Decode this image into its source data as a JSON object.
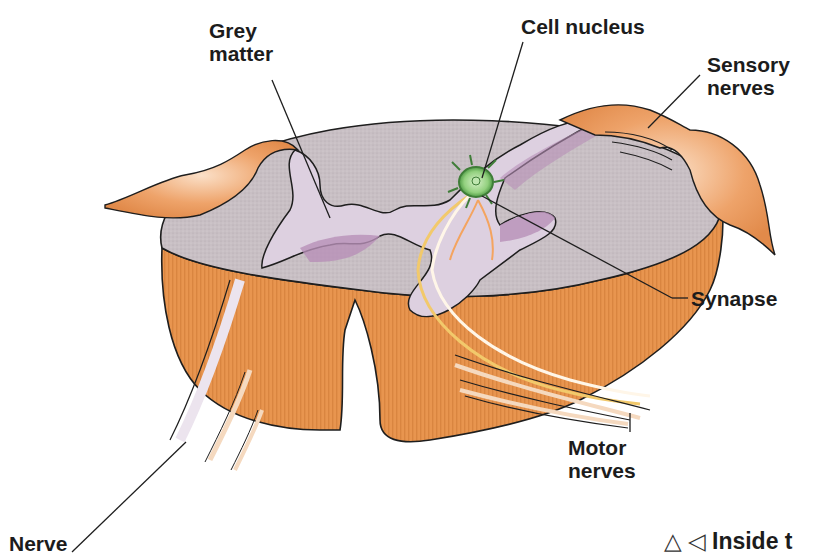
{
  "diagram": {
    "colors": {
      "white_matter": "#c9c0c4",
      "grey_matter": "#ddd0e0",
      "grey_matter_shadow": "#b890b8",
      "cut_side": "#e8954f",
      "ganglion": "#eda066",
      "nucleus": "#8ccf7a",
      "nerve_fiber": "#f5d9bf",
      "outline": "#1e1e1e"
    },
    "labels": {
      "grey_matter": {
        "line1": "Grey",
        "line2": "matter"
      },
      "cell_nucleus": {
        "line1": "Cell nucleus"
      },
      "sensory_nerves": {
        "line1": "Sensory",
        "line2": "nerves"
      },
      "synapse": {
        "line1": "Synapse"
      },
      "motor_nerves": {
        "line1": "Motor",
        "line2": "nerves"
      },
      "nerve": {
        "line1": "Nerve"
      }
    },
    "caption": {
      "icon_up": "△",
      "icon_left": "◁",
      "text": "Inside t"
    }
  }
}
